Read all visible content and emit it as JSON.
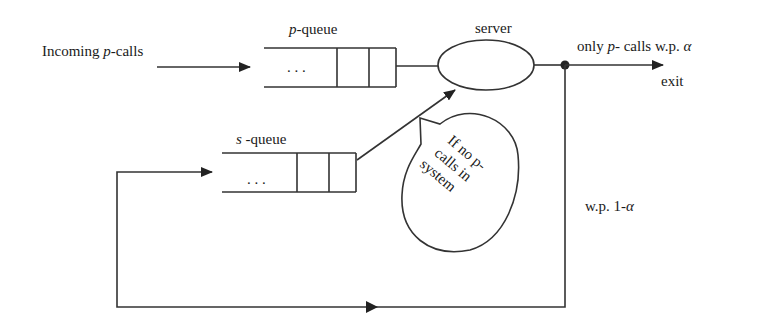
{
  "diagram": {
    "type": "queueing-system",
    "labels": {
      "incoming_prefix": "Incoming ",
      "incoming_var": "p",
      "incoming_suffix": "-calls",
      "p_queue_var": "p",
      "p_queue_suffix": "-queue",
      "s_queue_var": "s",
      "s_queue_suffix": " -queue",
      "server": "server",
      "only_prefix": "only ",
      "only_var": "p",
      "only_suffix": "- calls w.p. ",
      "alpha": "α",
      "exit": "exit",
      "wp_prefix": "w.p. 1-",
      "wp_alpha": "α",
      "ellipsis": ". . .",
      "bubble_line1": "If no p-",
      "bubble_line2": "calls in",
      "bubble_line3": "system"
    },
    "nodes": [
      {
        "id": "incoming",
        "label": "Incoming p-calls"
      },
      {
        "id": "p-queue",
        "label": "p-queue"
      },
      {
        "id": "s-queue",
        "label": "s -queue"
      },
      {
        "id": "server",
        "label": "server"
      },
      {
        "id": "exit",
        "label": "exit"
      },
      {
        "id": "note",
        "label": "If no p- calls in system"
      }
    ],
    "edges": [
      {
        "from": "incoming",
        "to": "p-queue"
      },
      {
        "from": "p-queue",
        "to": "server"
      },
      {
        "from": "s-queue",
        "to": "server",
        "condition": "If no p- calls in system"
      },
      {
        "from": "server",
        "to": "exit",
        "label": "only p- calls w.p. α"
      },
      {
        "from": "server",
        "to": "s-queue",
        "label": "w.p. 1-α"
      }
    ]
  }
}
